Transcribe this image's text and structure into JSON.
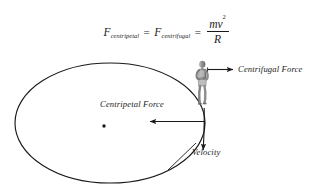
{
  "figure": {
    "background_color": "#ffffff",
    "stroke_color": "#1a1a1a"
  },
  "equation": {
    "left_symbol": "F",
    "left_subscript": "centripetal",
    "equals_1": "=",
    "middle_symbol": "F",
    "middle_subscript": "centrifugal",
    "equals_2": "=",
    "fraction_numerator": "mv",
    "fraction_numerator_exponent": "2",
    "fraction_denominator": "R",
    "plain_text": "F_centripetal = F_centrifugal = mv^2 / R"
  },
  "diagram": {
    "path_shape": "ellipse",
    "center_dot_label": "center-of-circular-path",
    "runner_label": "runner-figure",
    "labels": {
      "centrifugal": "Centrifugal Force",
      "centripetal": "Centripetal Force",
      "velocity": "Velocity"
    },
    "arrows": {
      "centrifugal_direction": "right",
      "centripetal_direction": "left",
      "velocity_direction": "down"
    }
  }
}
